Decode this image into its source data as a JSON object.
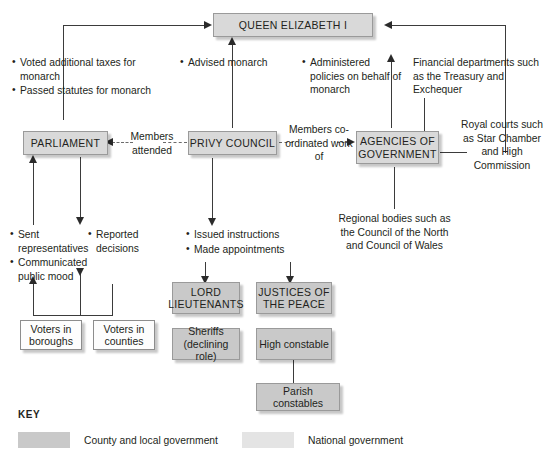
{
  "nodes": {
    "queen": "QUEEN ELIZABETH I",
    "parliament": "PARLIAMENT",
    "privy_council": "PRIVY COUNCIL",
    "agencies": "AGENCIES OF GOVERNMENT",
    "lord_lieutenants": "LORD LIEUTENANTS",
    "justices": "JUSTICES OF THE PEACE",
    "sheriffs": "Sheriffs (declining role)",
    "high_constable": "High constable",
    "parish_constables": "Parish constables",
    "voters_boroughs": "Voters in boroughs",
    "voters_counties": "Voters in counties"
  },
  "annotations": {
    "parliament_to_queen": [
      "Voted additional taxes for monarch",
      "Passed statutes for monarch"
    ],
    "privy_to_queen": [
      "Advised monarch"
    ],
    "agencies_to_queen": [
      "Administered policies on behalf of monarch"
    ],
    "financial_departments": "Financial departments such as the Treasury and Exchequer",
    "royal_courts": "Royal courts such as Star Chamber and High Commission",
    "regional_bodies": "Regional bodies such as the Council of the North and Council of Wales",
    "members_attended": "Members attended",
    "members_coordinated": "Members co-ordinated work of",
    "voters_to_parliament": [
      "Sent representatives",
      "Communicated public mood"
    ],
    "parliament_to_voters": [
      "Reported decisions"
    ],
    "privy_downward": [
      "Issued instructions",
      "Made appointments"
    ]
  },
  "key": {
    "label": "KEY",
    "items": [
      {
        "swatch_color": "#c9c9c9",
        "label": "County and local government"
      },
      {
        "swatch_color": "#e4e4e4",
        "label": "National government"
      }
    ]
  }
}
